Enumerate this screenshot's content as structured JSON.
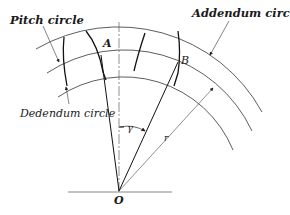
{
  "diagram": {
    "labels": {
      "pitch_circle": "Pitch circle",
      "addendum_circle": "Addendum circle",
      "dedendum_circle": "Dedendum circle",
      "point_a": "A",
      "point_b": "B",
      "center": "O",
      "angle": "γ",
      "radius": "r"
    },
    "colors": {
      "line": "#222222",
      "thin_line": "#555555",
      "background": "#ffffff"
    }
  }
}
